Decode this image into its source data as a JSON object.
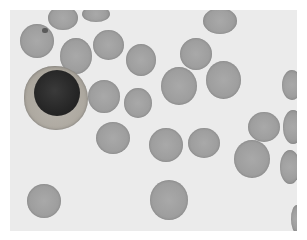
{
  "image": {
    "caption": "Blood smear micrograph: leukocyte with dark nucleus surrounded by red blood cells",
    "background_color": "#ebebeb",
    "rbc_color": "#a0a0a0",
    "nucleus_color": "#262626",
    "cytoplasm_color": "#aaa59c"
  },
  "cells": {
    "rbc": [
      {
        "x": 20,
        "y": 24,
        "w": 34,
        "h": 34
      },
      {
        "x": 48,
        "y": 6,
        "w": 30,
        "h": 24
      },
      {
        "x": 82,
        "y": 6,
        "w": 28,
        "h": 16
      },
      {
        "x": 60,
        "y": 38,
        "w": 32,
        "h": 36
      },
      {
        "x": 93,
        "y": 30,
        "w": 31,
        "h": 30
      },
      {
        "x": 126,
        "y": 44,
        "w": 30,
        "h": 32
      },
      {
        "x": 88,
        "y": 80,
        "w": 32,
        "h": 33
      },
      {
        "x": 124,
        "y": 88,
        "w": 28,
        "h": 30
      },
      {
        "x": 203,
        "y": 8,
        "w": 34,
        "h": 26
      },
      {
        "x": 180,
        "y": 38,
        "w": 32,
        "h": 32
      },
      {
        "x": 161,
        "y": 67,
        "w": 36,
        "h": 38
      },
      {
        "x": 206,
        "y": 61,
        "w": 35,
        "h": 38
      },
      {
        "x": 282,
        "y": 70,
        "w": 20,
        "h": 30
      },
      {
        "x": 96,
        "y": 122,
        "w": 34,
        "h": 32
      },
      {
        "x": 149,
        "y": 128,
        "w": 34,
        "h": 34
      },
      {
        "x": 188,
        "y": 128,
        "w": 32,
        "h": 30
      },
      {
        "x": 234,
        "y": 140,
        "w": 36,
        "h": 38
      },
      {
        "x": 248,
        "y": 112,
        "w": 32,
        "h": 30
      },
      {
        "x": 283,
        "y": 110,
        "w": 20,
        "h": 34
      },
      {
        "x": 280,
        "y": 150,
        "w": 20,
        "h": 34
      },
      {
        "x": 27,
        "y": 184,
        "w": 34,
        "h": 34
      },
      {
        "x": 150,
        "y": 180,
        "w": 38,
        "h": 40
      },
      {
        "x": 291,
        "y": 205,
        "w": 12,
        "h": 28
      }
    ],
    "wbc": {
      "x": 24,
      "y": 66,
      "w": 64,
      "h": 64
    },
    "nucleus": {
      "x": 34,
      "y": 70,
      "w": 46,
      "h": 46
    },
    "platelet": {
      "x": 42,
      "y": 28
    }
  }
}
